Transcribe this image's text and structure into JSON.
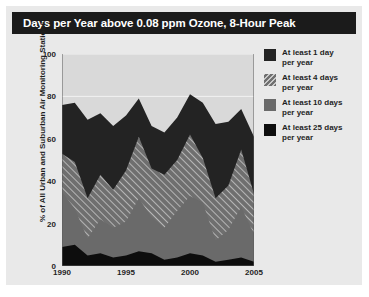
{
  "card": {
    "title": "Days per Year above 0.08 ppm Ozone, 8-Hour Peak",
    "background_color": "#e9e9e9",
    "title_bar_color": "#1b1b1b",
    "title_text_color": "#ffffff"
  },
  "legend": {
    "position": "right",
    "entries": [
      {
        "label": "At least 1 day\nper year",
        "swatch": "dark-solid",
        "color": "#232323"
      },
      {
        "label": "At least 4 days\nper year",
        "swatch": "gray-hatched",
        "color": "#6f6f6f"
      },
      {
        "label": "At least 10 days\nper year",
        "swatch": "gray-solid",
        "color": "#6a6a6a"
      },
      {
        "label": "At least 25 days\nper year",
        "swatch": "black-solid",
        "color": "#0d0d0d"
      }
    ]
  },
  "chart_data": {
    "type": "area",
    "title": "Days per Year above 0.08 ppm Ozone, 8-Hour Peak",
    "xlabel": "",
    "ylabel": "% of All Urban and Suburban Air Monitoring Stations",
    "xlim": [
      1990,
      2005
    ],
    "ylim": [
      0,
      100
    ],
    "grid": true,
    "overlapping": true,
    "x": [
      1990,
      1991,
      1992,
      1993,
      1994,
      1995,
      1996,
      1997,
      1998,
      1999,
      2000,
      2001,
      2002,
      2003,
      2004,
      2005
    ],
    "xticks": [
      1990,
      1995,
      2000,
      2005
    ],
    "yticks": [
      0,
      20,
      40,
      60,
      80,
      100
    ],
    "series": [
      {
        "name": "At least 1 day per year",
        "color": "#232323",
        "fill": "solid",
        "values": [
          76,
          77,
          69,
          72,
          66,
          71,
          79,
          66,
          63,
          70,
          81,
          77,
          67,
          68,
          74,
          61
        ]
      },
      {
        "name": "At least 4 days per year",
        "color": "#6f6f6f",
        "fill": "hatched",
        "values": [
          53,
          49,
          32,
          43,
          36,
          45,
          61,
          46,
          43,
          50,
          62,
          51,
          32,
          38,
          55,
          34
        ]
      },
      {
        "name": "At least 10 days per year",
        "color": "#6a6a6a",
        "fill": "solid",
        "values": [
          35,
          27,
          13,
          22,
          18,
          21,
          32,
          23,
          18,
          26,
          33,
          30,
          12,
          17,
          28,
          15
        ]
      },
      {
        "name": "At least 25 days per year",
        "color": "#0d0d0d",
        "fill": "solid",
        "values": [
          9,
          10,
          5,
          6,
          4,
          5,
          7,
          6,
          3,
          4,
          6,
          5,
          2,
          3,
          4,
          2
        ]
      }
    ]
  }
}
